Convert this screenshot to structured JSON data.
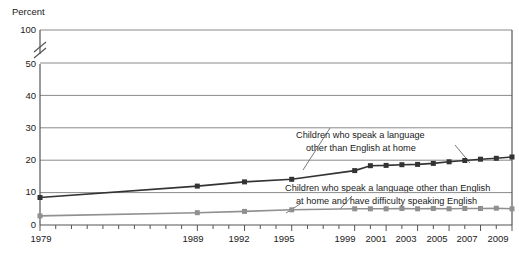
{
  "chart_data": {
    "type": "line",
    "title": "",
    "ylabel": "Percent",
    "xlabel": "",
    "grid": true,
    "legend": "annotations",
    "axis_break": {
      "between": [
        50,
        100
      ],
      "symbol": "//"
    },
    "ylim": [
      0,
      100
    ],
    "y_ticks": [
      0,
      10,
      20,
      30,
      40,
      50,
      100
    ],
    "y_tick_labels": [
      "0",
      "10",
      "20",
      "30",
      "40",
      "50",
      "100"
    ],
    "x": [
      1979,
      1980,
      1981,
      1982,
      1983,
      1984,
      1985,
      1986,
      1987,
      1988,
      1989,
      1990,
      1991,
      1992,
      1993,
      1994,
      1995,
      1996,
      1997,
      1998,
      1999,
      2000,
      2001,
      2002,
      2003,
      2004,
      2005,
      2006,
      2007,
      2008,
      2009
    ],
    "x_tick_labels": [
      "1979",
      "1989",
      "1992",
      "1995",
      "1999",
      "2001",
      "2003",
      "2005",
      "2007",
      "2009"
    ],
    "x_tick_label_years": [
      1979,
      1989,
      1992,
      1995,
      1999,
      2001,
      2003,
      2005,
      2007,
      2009
    ],
    "series": [
      {
        "name": "Children who speak a language other than English at home",
        "color": "#333333",
        "marker": "square",
        "points": [
          {
            "year": 1979,
            "value": 8.5
          },
          {
            "year": 1989,
            "value": 12.0
          },
          {
            "year": 1992,
            "value": 13.3
          },
          {
            "year": 1995,
            "value": 14.1
          },
          {
            "year": 1999,
            "value": 16.8
          },
          {
            "year": 2000,
            "value": 18.3
          },
          {
            "year": 2001,
            "value": 18.4
          },
          {
            "year": 2002,
            "value": 18.6
          },
          {
            "year": 2003,
            "value": 18.7
          },
          {
            "year": 2004,
            "value": 19.0
          },
          {
            "year": 2005,
            "value": 19.5
          },
          {
            "year": 2006,
            "value": 19.9
          },
          {
            "year": 2007,
            "value": 20.3
          },
          {
            "year": 2008,
            "value": 20.6
          },
          {
            "year": 2009,
            "value": 21.0
          }
        ]
      },
      {
        "name": "Children who speak a language other than English at home and have difficulty speaking English",
        "color": "#909090",
        "marker": "square",
        "points": [
          {
            "year": 1979,
            "value": 2.8
          },
          {
            "year": 1989,
            "value": 3.8
          },
          {
            "year": 1992,
            "value": 4.2
          },
          {
            "year": 1995,
            "value": 4.7
          },
          {
            "year": 1999,
            "value": 5.0
          },
          {
            "year": 2000,
            "value": 5.0
          },
          {
            "year": 2001,
            "value": 5.0
          },
          {
            "year": 2002,
            "value": 5.1
          },
          {
            "year": 2003,
            "value": 5.0
          },
          {
            "year": 2004,
            "value": 5.1
          },
          {
            "year": 2005,
            "value": 5.0
          },
          {
            "year": 2006,
            "value": 5.1
          },
          {
            "year": 2007,
            "value": 5.1
          },
          {
            "year": 2008,
            "value": 5.2
          },
          {
            "year": 2009,
            "value": 5.0
          }
        ]
      }
    ],
    "annotations": [
      {
        "id": "annotation-top",
        "lines": [
          "Children who speak a language",
          "other than English at home"
        ],
        "line1": "Children who speak a language",
        "line2": "other than English at home"
      },
      {
        "id": "annotation-bottom",
        "lines": [
          "Children who speak a language other than English",
          "at home and have difficulty speaking English"
        ],
        "line1": "Children who speak a language other than English",
        "line2": "at home and have difficulty speaking English"
      }
    ]
  },
  "axis": {
    "percent_label": "Percent",
    "y": {
      "t100": "100",
      "t50": "50",
      "t40": "40",
      "t30": "30",
      "t20": "20",
      "t10": "10",
      "t0": "0"
    },
    "x": {
      "y1979": "1979",
      "y1989": "1989",
      "y1992": "1992",
      "y1995": "1995",
      "y1999": "1999",
      "y2001": "2001",
      "y2003": "2003",
      "y2005": "2005",
      "y2007": "2007",
      "y2009": "2009"
    }
  },
  "colors": {
    "series_dark": "#333333",
    "series_light": "#909090",
    "grid": "#8a8a8a",
    "frame": "#555555",
    "text": "#1a1a1a"
  }
}
